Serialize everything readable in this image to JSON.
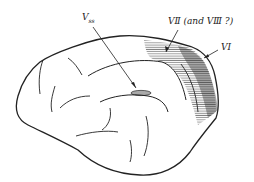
{
  "diagram": {
    "labels": {
      "vss": {
        "main": "V",
        "sub": "ss"
      },
      "v2": "VⅡ (and VⅢ ?)",
      "v1": "VⅠ"
    },
    "colors": {
      "line": "#222222",
      "hatch": "#333333",
      "background": "#ffffff"
    }
  }
}
